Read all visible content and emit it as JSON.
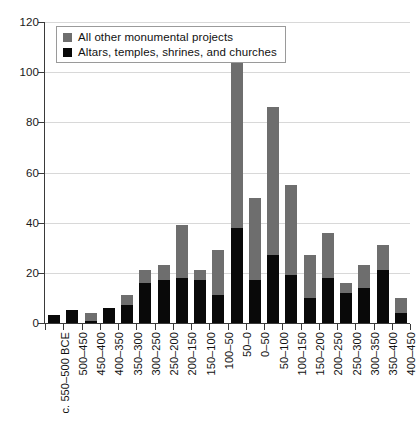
{
  "chart_data": {
    "type": "bar",
    "stacked": true,
    "title": "",
    "subtitle": "",
    "xlabel": "",
    "ylabel": "",
    "ylim": [
      0,
      120
    ],
    "ytick_step": 20,
    "yticks": [
      0,
      20,
      40,
      60,
      80,
      100,
      120
    ],
    "grid": "horizontal",
    "legend_position": "top-left",
    "categories": [
      "c. 550–500 BCE",
      "500–450",
      "450–400",
      "400–350",
      "350–300",
      "300–250",
      "250–200",
      "200–150",
      "150–100",
      "100–50",
      "50–0",
      "0–50",
      "50–100",
      "100–150",
      "150–200",
      "200–250",
      "250–300",
      "300–350",
      "350–400",
      "400–450"
    ],
    "series": [
      {
        "name": "Altars, temples, shrines, and churches",
        "color": "#090909",
        "values": [
          3,
          5,
          1,
          6,
          7,
          16,
          17,
          18,
          17,
          11,
          38,
          17,
          27,
          19,
          10,
          18,
          12,
          14,
          21,
          4
        ]
      },
      {
        "name": "All other monumental projects",
        "color": "#6e6e6e",
        "values": [
          0,
          0,
          3,
          0,
          4,
          5,
          6,
          21,
          4,
          18,
          70,
          33,
          59,
          36,
          17,
          18,
          4,
          9,
          10,
          6
        ]
      }
    ],
    "totals": [
      3,
      5,
      4,
      6,
      11,
      21,
      23,
      39,
      21,
      29,
      108,
      50,
      86,
      55,
      27,
      36,
      16,
      23,
      31,
      10
    ]
  },
  "legend": {
    "items": [
      {
        "label": "All other monumental projects",
        "swatch": "gray"
      },
      {
        "label": "Altars, temples, shrines, and churches",
        "swatch": "black"
      }
    ]
  },
  "axes": {
    "y_tick_labels": [
      "120",
      "100",
      "80",
      "60",
      "40",
      "20",
      "0"
    ]
  }
}
